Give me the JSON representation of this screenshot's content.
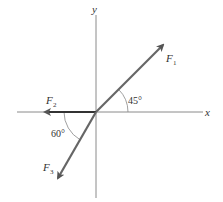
{
  "diagram": {
    "type": "force-vector-diagram",
    "colors": {
      "background": "#ffffff",
      "axis": "#8a8a8a",
      "vector": "#555555",
      "vector_dark": "#333333",
      "arc": "#888888",
      "text": "#333333"
    },
    "axes": {
      "x_label": "x",
      "y_label": "y"
    },
    "vectors": [
      {
        "id": "F1",
        "label_main": "F",
        "label_sub": "1",
        "direction": "45° above +x axis"
      },
      {
        "id": "F2",
        "label_main": "F",
        "label_sub": "2",
        "direction": "along -x axis"
      },
      {
        "id": "F3",
        "label_main": "F",
        "label_sub": "3",
        "direction": "60° below -x axis"
      }
    ],
    "angles": [
      {
        "id": "angle-45",
        "text": "45°",
        "between": "+x axis and F1"
      },
      {
        "id": "angle-60",
        "text": "60°",
        "between": "-x axis and F3"
      }
    ]
  }
}
